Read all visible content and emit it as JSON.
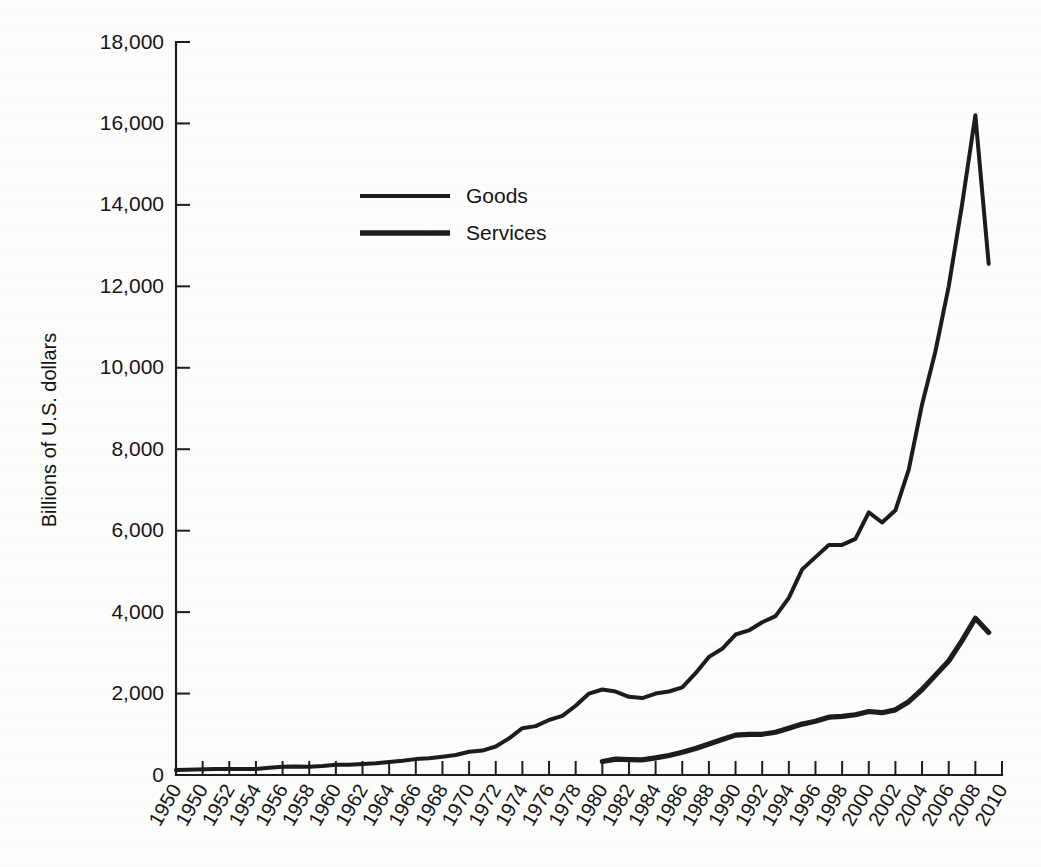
{
  "chart_data": {
    "type": "line",
    "title": "",
    "xlabel": "",
    "ylabel": "Billions of U.S. dollars",
    "ylim": [
      0,
      18000
    ],
    "ytick_values": [
      0,
      2000,
      4000,
      6000,
      8000,
      10000,
      12000,
      14000,
      16000,
      18000
    ],
    "ytick_labels": [
      "0",
      "2,000",
      "4,000",
      "6,000",
      "8,000",
      "10,000",
      "12,000",
      "14,000",
      "16,000",
      "18,000"
    ],
    "xtick_labels": [
      "1950",
      "1950",
      "1952",
      "1954",
      "1956",
      "1958",
      "1960",
      "1962",
      "1964",
      "1966",
      "1968",
      "1970",
      "1972",
      "1974",
      "1976",
      "1978",
      "1980",
      "1982",
      "1984",
      "1986",
      "1988",
      "1990",
      "1992",
      "1994",
      "1996",
      "1998",
      "2000",
      "2002",
      "2004",
      "2006",
      "2008",
      "2010"
    ],
    "x": [
      1950,
      1951,
      1952,
      1953,
      1954,
      1955,
      1956,
      1957,
      1958,
      1959,
      1960,
      1961,
      1962,
      1963,
      1964,
      1965,
      1966,
      1967,
      1968,
      1969,
      1970,
      1971,
      1972,
      1973,
      1974,
      1975,
      1976,
      1977,
      1978,
      1979,
      1980,
      1981,
      1982,
      1983,
      1984,
      1985,
      1986,
      1987,
      1988,
      1989,
      1990,
      1991,
      1992,
      1993,
      1994,
      1995,
      1996,
      1997,
      1998,
      1999,
      2000,
      2001,
      2002,
      2003,
      2004,
      2005,
      2006,
      2007,
      2008,
      2009
    ],
    "grid": false,
    "legend_position": "upper-center-left",
    "series": [
      {
        "name": "Goods",
        "line_width": "thin",
        "color": "#1c1c1c",
        "values": [
          120,
          150,
          150,
          150,
          150,
          180,
          200,
          210,
          200,
          220,
          250,
          250,
          270,
          290,
          320,
          350,
          390,
          410,
          450,
          490,
          570,
          600,
          700,
          900,
          1150,
          1200,
          1350,
          1450,
          1700,
          2000,
          2100,
          2050,
          1920,
          1890,
          2000,
          2050,
          2150,
          2500,
          2900,
          3100,
          3450,
          3550,
          3750,
          3900,
          4350,
          5050,
          5350,
          5650,
          5650,
          5800,
          6450,
          6200,
          6500,
          7500,
          9100,
          10400,
          12000,
          14000,
          16200,
          12550
        ]
      },
      {
        "name": "Services",
        "line_width": "thick",
        "color": "#1c1c1c",
        "values": [
          null,
          null,
          null,
          null,
          null,
          null,
          null,
          null,
          null,
          null,
          null,
          null,
          null,
          null,
          null,
          null,
          null,
          null,
          null,
          null,
          null,
          null,
          null,
          null,
          null,
          null,
          null,
          null,
          null,
          null,
          330,
          390,
          380,
          370,
          420,
          480,
          560,
          650,
          760,
          870,
          980,
          1000,
          1000,
          1050,
          1150,
          1250,
          1320,
          1420,
          1440,
          1480,
          1560,
          1530,
          1600,
          1800,
          2100,
          2450,
          2800,
          3300,
          3850,
          3500
        ]
      }
    ],
    "legend": [
      {
        "label": "Goods"
      },
      {
        "label": "Services"
      }
    ]
  },
  "axes": {
    "y_axis_title": "Billions of U.S. dollars"
  }
}
